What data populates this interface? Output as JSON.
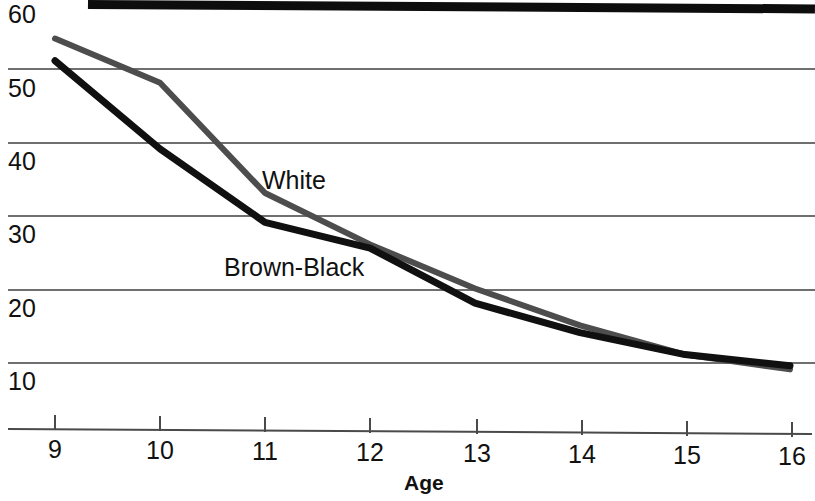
{
  "chart_data": {
    "type": "line",
    "title": "",
    "xlabel": "Age",
    "ylabel": "",
    "x": [
      9,
      10,
      11,
      12,
      13,
      14,
      15,
      16
    ],
    "xticklabels": [
      "9",
      "10",
      "11",
      "12",
      "13",
      "14",
      "15",
      "16"
    ],
    "yticklabels": [
      "60",
      "50",
      "40",
      "30",
      "20",
      "10"
    ],
    "yticks": [
      60,
      50,
      40,
      30,
      20,
      10
    ],
    "xlim": [
      9,
      16
    ],
    "ylim": [
      5,
      60
    ],
    "grid": true,
    "legend_position": "inline-annotations",
    "series": [
      {
        "name": "White",
        "color": "#4d4d4d",
        "values": [
          54,
          48,
          33,
          26,
          20,
          15,
          11,
          9
        ]
      },
      {
        "name": "Brown-Black",
        "color": "#101010",
        "values": [
          51,
          39,
          29,
          25.5,
          18,
          14,
          11,
          9.5
        ]
      }
    ],
    "annotations": [
      {
        "text": "White",
        "x": 11.0,
        "y": 36
      },
      {
        "text": "Brown-Black",
        "x": 10.6,
        "y": 23.5
      }
    ]
  },
  "axis": {
    "x_title": "Age"
  }
}
